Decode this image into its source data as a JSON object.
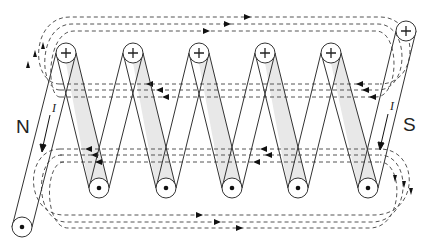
{
  "diagram": {
    "labels": {
      "north_pole": "N",
      "south_pole": "S",
      "current_left": "I",
      "current_right": "I"
    },
    "symbols": {
      "current_out": "+",
      "current_in": "•"
    },
    "colors": {
      "wire": "#333333",
      "flux_line": "#555555",
      "shading": "#e6e6e6",
      "background": "#ffffff"
    },
    "turns": 5,
    "top_conductors": [
      {
        "x": 66,
        "y": 53
      },
      {
        "x": 133,
        "y": 53
      },
      {
        "x": 199,
        "y": 53
      },
      {
        "x": 265,
        "y": 53
      },
      {
        "x": 331,
        "y": 53
      }
    ],
    "bottom_conductors": [
      {
        "x": 99,
        "y": 188
      },
      {
        "x": 166,
        "y": 188
      },
      {
        "x": 232,
        "y": 188
      },
      {
        "x": 298,
        "y": 188
      },
      {
        "x": 368,
        "y": 188
      }
    ],
    "lead_in": {
      "x": 22,
      "y": 227,
      "symbol": "•"
    },
    "lead_out": {
      "x": 406,
      "y": 31,
      "symbol": "+"
    }
  }
}
